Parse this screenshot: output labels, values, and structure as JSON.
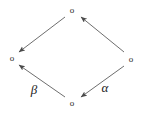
{
  "diagram": {
    "type": "commutative-diagram",
    "shape": "diamond",
    "background_color": "#ffffff",
    "line_color": "#6e6e6e",
    "label_color": "#222222",
    "vertex_color": "#2b2b2b",
    "vertex_glyph": "o",
    "vertices": [
      {
        "id": "top",
        "glyph": "o",
        "x": 72,
        "y": 10
      },
      {
        "id": "left",
        "glyph": "o",
        "x": 12,
        "y": 58
      },
      {
        "id": "right",
        "glyph": "o",
        "x": 131,
        "y": 59
      },
      {
        "id": "bottom",
        "glyph": "o",
        "x": 72,
        "y": 103
      }
    ],
    "edges": [
      {
        "id": "top-to-left",
        "from": "top",
        "to": "left",
        "label": "",
        "arrowhead": "end",
        "x1": 65,
        "y1": 17,
        "x2": 19,
        "y2": 52
      },
      {
        "id": "right-to-top",
        "from": "right",
        "to": "top",
        "label": "",
        "arrowhead": "end",
        "x1": 124,
        "y1": 52,
        "x2": 81,
        "y2": 17
      },
      {
        "id": "bottom-to-left",
        "from": "bottom",
        "to": "left",
        "label": "β",
        "arrowhead": "end",
        "x1": 65,
        "y1": 97,
        "x2": 19,
        "y2": 65
      },
      {
        "id": "right-to-bottom",
        "from": "right",
        "to": "bottom",
        "label": "α",
        "arrowhead": "end",
        "x1": 124,
        "y1": 66,
        "x2": 81,
        "y2": 97
      }
    ],
    "labels": [
      {
        "id": "beta-label",
        "text": "β",
        "x": 34,
        "y": 89
      },
      {
        "id": "alpha-label",
        "text": "α",
        "x": 105,
        "y": 87
      }
    ]
  }
}
